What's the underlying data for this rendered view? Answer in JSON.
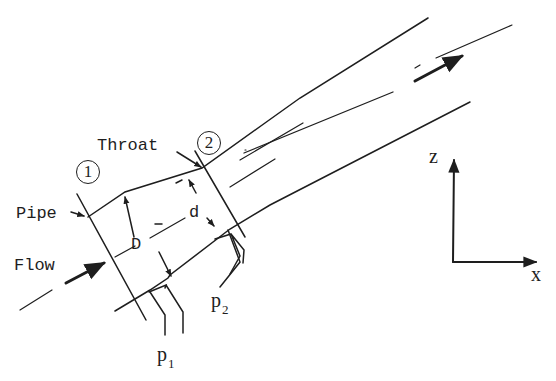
{
  "diagram": {
    "type": "venturi-meter-schematic",
    "labels": {
      "throat": "Throat",
      "pipe": "Pipe",
      "flow": "Flow",
      "section_1": "1",
      "section_2": "2",
      "pipe_diameter": "D",
      "throat_diameter": "d",
      "pressure_1": "p",
      "pressure_1_sub": "1",
      "pressure_2": "p",
      "pressure_2_sub": "2",
      "axis_z": "z",
      "axis_x": "x"
    },
    "colors": {
      "ink": "#1e1e1e",
      "background": "#ffffff"
    }
  }
}
